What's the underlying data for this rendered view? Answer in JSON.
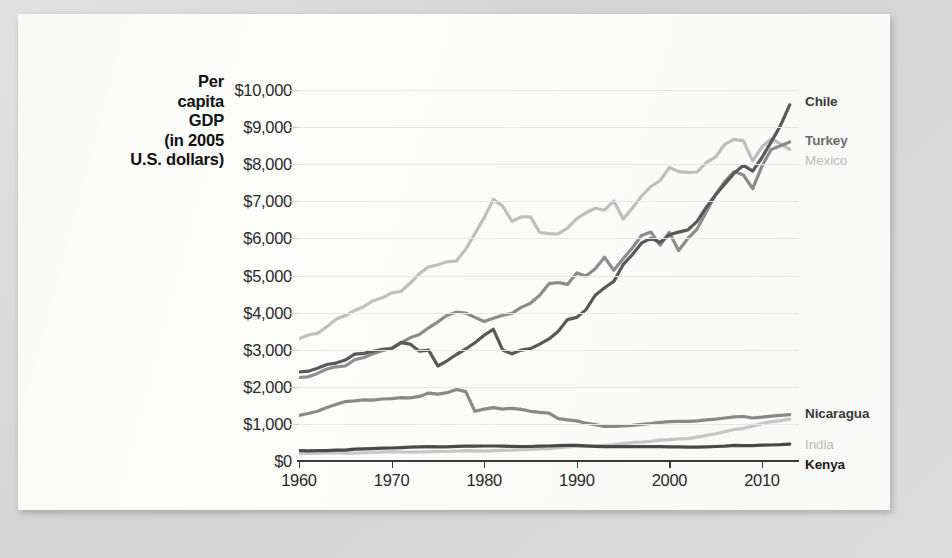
{
  "figure": {
    "y_axis_title": "Per capita GDP (in 2005 U.S. dollars)",
    "y_axis_title_lines": [
      "Per",
      "capita",
      "GDP",
      "(in 2005",
      "U.S. dollars)"
    ]
  },
  "chart_data": {
    "type": "line",
    "title": "",
    "xlabel": "",
    "ylabel": "Per capita GDP (in 2005 U.S. dollars)",
    "xlim": [
      1960,
      2014
    ],
    "ylim": [
      0,
      10000
    ],
    "xticks": [
      1960,
      1970,
      1980,
      1990,
      2000,
      2010
    ],
    "xticklabels": [
      "1960",
      "1970",
      "1980",
      "1990",
      "2000",
      "2010"
    ],
    "yticks": [
      0,
      1000,
      2000,
      3000,
      4000,
      5000,
      6000,
      7000,
      8000,
      9000,
      10000
    ],
    "yticklabels": [
      "$0",
      "$1,000",
      "$2,000",
      "$3,000",
      "$4,000",
      "$5,000",
      "$6,000",
      "$7,000",
      "$8,000",
      "$9,000",
      "$10,000"
    ],
    "grid": true,
    "grid_axis": "y",
    "legend_position": "right-inline-labels",
    "x": [
      1960,
      1961,
      1962,
      1963,
      1964,
      1965,
      1966,
      1967,
      1968,
      1969,
      1970,
      1971,
      1972,
      1973,
      1974,
      1975,
      1976,
      1977,
      1978,
      1979,
      1980,
      1981,
      1982,
      1983,
      1984,
      1985,
      1986,
      1987,
      1988,
      1989,
      1990,
      1991,
      1992,
      1993,
      1994,
      1995,
      1996,
      1997,
      1998,
      1999,
      2000,
      2001,
      2002,
      2003,
      2004,
      2005,
      2006,
      2007,
      2008,
      2009,
      2010,
      2011,
      2012,
      2013
    ],
    "series": [
      {
        "name": "Chile",
        "color": "#5a5a5a",
        "label_color": "#3a3a3a",
        "label_bold": true,
        "end_value": 9600,
        "values": [
          2400,
          2420,
          2500,
          2600,
          2640,
          2720,
          2880,
          2900,
          2960,
          3010,
          3030,
          3190,
          3150,
          2960,
          2990,
          2560,
          2700,
          2870,
          3020,
          3190,
          3390,
          3550,
          2990,
          2890,
          2990,
          3030,
          3150,
          3290,
          3500,
          3810,
          3870,
          4080,
          4470,
          4670,
          4840,
          5290,
          5560,
          5880,
          6000,
          5890,
          6100,
          6170,
          6230,
          6460,
          6840,
          7180,
          7470,
          7760,
          7970,
          7810,
          8180,
          8600,
          9040,
          9600
        ]
      },
      {
        "name": "Turkey",
        "color": "#8d8d8d",
        "label_color": "#6e6e6e",
        "label_bold": true,
        "end_value": 8600,
        "values": [
          2250,
          2270,
          2360,
          2480,
          2540,
          2560,
          2730,
          2790,
          2890,
          2970,
          3040,
          3180,
          3320,
          3410,
          3590,
          3750,
          3930,
          4010,
          3990,
          3870,
          3760,
          3850,
          3930,
          3980,
          4140,
          4250,
          4470,
          4780,
          4810,
          4760,
          5070,
          4990,
          5180,
          5490,
          5140,
          5450,
          5740,
          6080,
          6170,
          5820,
          6160,
          5670,
          6000,
          6250,
          6720,
          7190,
          7540,
          7800,
          7710,
          7340,
          7950,
          8400,
          8500,
          8600
        ]
      },
      {
        "name": "Mexico",
        "color": "#c0c0c0",
        "label_color": "#bdbdbd",
        "label_bold": false,
        "end_value": 8400,
        "values": [
          3300,
          3400,
          3440,
          3620,
          3820,
          3920,
          4060,
          4160,
          4320,
          4400,
          4530,
          4570,
          4790,
          5050,
          5230,
          5290,
          5370,
          5390,
          5710,
          6130,
          6560,
          7050,
          6870,
          6460,
          6580,
          6580,
          6160,
          6130,
          6120,
          6280,
          6530,
          6690,
          6810,
          6760,
          7010,
          6520,
          6810,
          7140,
          7400,
          7560,
          7910,
          7800,
          7780,
          7790,
          8050,
          8200,
          8540,
          8670,
          8630,
          8090,
          8470,
          8690,
          8550,
          8400
        ]
      },
      {
        "name": "Nicaragua",
        "color": "#8a8a8a",
        "label_color": "#3a3a3a",
        "label_bold": true,
        "end_value": 1200,
        "values": [
          1230,
          1280,
          1340,
          1440,
          1520,
          1600,
          1620,
          1650,
          1640,
          1670,
          1680,
          1710,
          1700,
          1740,
          1830,
          1800,
          1840,
          1930,
          1870,
          1340,
          1400,
          1440,
          1400,
          1420,
          1390,
          1340,
          1310,
          1290,
          1140,
          1110,
          1080,
          1020,
          980,
          930,
          930,
          950,
          960,
          990,
          1010,
          1040,
          1060,
          1070,
          1070,
          1080,
          1110,
          1130,
          1160,
          1190,
          1200,
          1160,
          1180,
          1210,
          1230,
          1250
        ]
      },
      {
        "name": "India",
        "color": "#c8c8c8",
        "label_color": "#bdbdbd",
        "label_bold": false,
        "end_value": 700,
        "values": [
          200,
          205,
          205,
          215,
          225,
          210,
          210,
          225,
          230,
          240,
          250,
          245,
          240,
          245,
          245,
          260,
          255,
          270,
          280,
          275,
          265,
          280,
          285,
          295,
          305,
          315,
          325,
          335,
          360,
          380,
          395,
          390,
          405,
          420,
          440,
          465,
          495,
          510,
          530,
          560,
          575,
          595,
          605,
          645,
          690,
          735,
          790,
          850,
          880,
          940,
          1010,
          1060,
          1090,
          1130
        ]
      },
      {
        "name": "Kenya",
        "color": "#4a4a4a",
        "label_color": "#1a1a1a",
        "label_bold": true,
        "end_value": 480,
        "values": [
          280,
          275,
          280,
          280,
          290,
          290,
          320,
          325,
          335,
          345,
          350,
          360,
          375,
          380,
          385,
          380,
          380,
          395,
          400,
          400,
          405,
          405,
          400,
          395,
          390,
          390,
          400,
          405,
          415,
          420,
          420,
          410,
          395,
          385,
          385,
          385,
          390,
          385,
          385,
          385,
          380,
          380,
          375,
          375,
          380,
          390,
          400,
          420,
          415,
          415,
          425,
          430,
          440,
          455
        ]
      }
    ]
  },
  "series_labels": [
    {
      "name": "Chile"
    },
    {
      "name": "Turkey"
    },
    {
      "name": "Mexico"
    },
    {
      "name": "Nicaragua"
    },
    {
      "name": "India"
    },
    {
      "name": "Kenya"
    }
  ]
}
